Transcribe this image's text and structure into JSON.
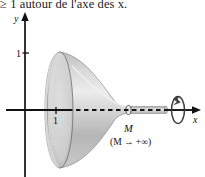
{
  "figure": {
    "caption": "≥ 1 autour de l'axe des x.",
    "description_name": "gabriels-horn-solid-of-revolution",
    "width": 205,
    "height": 177,
    "axes": {
      "y_label": "y",
      "x_label": "x",
      "y_tick_label": "1",
      "x_tick_label": "1",
      "origin_px": {
        "x": 25,
        "y": 110
      },
      "y_tick_px": {
        "x": 25,
        "y": 53
      },
      "x_tick_px": {
        "x": 56,
        "y": 110
      },
      "x_axis_end_px": 200,
      "y_axis_top_px": 15,
      "y_axis_bottom_px": 177
    },
    "annotations": {
      "point_m": "M",
      "limit_m": "(M → +∞)",
      "rotation_arrow_name": "revolution-arrow"
    },
    "colors": {
      "stroke": "#1a1a1a",
      "surface_light": "#e2e2e2",
      "surface_mid": "#c8c8c8",
      "surface_dark": "#a8a8a8",
      "surface_edge": "#8d8d8d",
      "background": "#ffffff"
    },
    "geometry": {
      "bell_rim_center_x": 60,
      "bell_rim_rx": 13,
      "bell_rim_ry": 58,
      "throat_x": 128,
      "tube_end_x": 166,
      "tube_half_height": 3.2
    }
  }
}
